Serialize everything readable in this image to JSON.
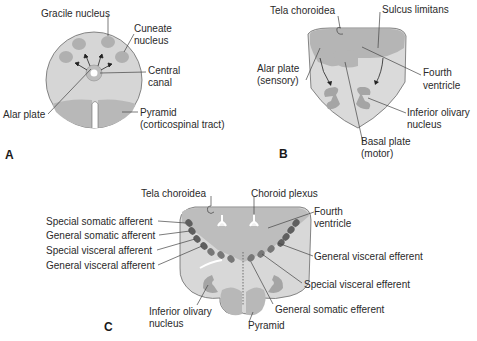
{
  "colors": {
    "background": "#ffffff",
    "tissue_light": "#d9d9d9",
    "tissue_mid": "#bfbfbf",
    "tissue_dark": "#a8a8a8",
    "nucleus_dark": "#5a5a5a",
    "text": "#2a2a2a"
  },
  "panels": {
    "A": {
      "letter": "A",
      "labels": {
        "gracile": "Gracile nucleus",
        "cuneate_1": "Cuneate",
        "cuneate_2": "nucleus",
        "central_1": "Central",
        "central_2": "canal",
        "alar": "Alar plate",
        "pyramid_1": "Pyramid",
        "pyramid_2": "(corticospinal tract)"
      }
    },
    "B": {
      "letter": "B",
      "labels": {
        "tela": "Tela choroidea",
        "sulcus": "Sulcus limitans",
        "alar_1": "Alar plate",
        "alar_2": "(sensory)",
        "fourth_1": "Fourth",
        "fourth_2": "ventricle",
        "olivary_1": "Inferior olivary",
        "olivary_2": "nucleus",
        "basal_1": "Basal plate",
        "basal_2": "(motor)"
      }
    },
    "C": {
      "letter": "C",
      "labels": {
        "tela": "Tela choroidea",
        "choroid": "Choroid plexus",
        "fourth_1": "Fourth",
        "fourth_2": "ventricle",
        "ssa": "Special somatic afferent",
        "gsa": "General somatic afferent",
        "sva": "Special visceral afferent",
        "gva": "General visceral afferent",
        "gve": "General visceral efferent",
        "sve": "Special visceral efferent",
        "gse": "General somatic efferent",
        "olivary_1": "Inferior olivary",
        "olivary_2": "nucleus",
        "pyramid": "Pyramid"
      }
    }
  }
}
